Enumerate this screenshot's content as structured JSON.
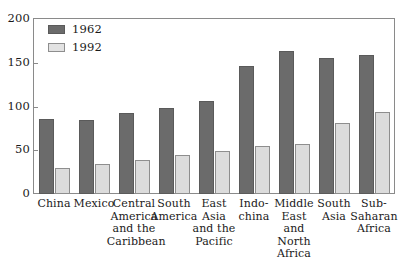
{
  "chart_data": {
    "type": "bar",
    "title": "",
    "subtitle": "",
    "xlabel": "",
    "ylabel": "",
    "ylim": [
      0,
      200
    ],
    "yticks": [
      0,
      50,
      100,
      150,
      200
    ],
    "grid": false,
    "legend_position": "top-left",
    "categories": [
      "China",
      "Mexico",
      "Central\nAmerica\nand the\nCaribbean",
      "South\nAmerica",
      "East\nAsia\nand the\nPacific",
      "Indo-\nchina",
      "Middle\nEast\nand\nNorth\nAfrica",
      "South\nAsia",
      "Sub-\nSaharan\nAfrica"
    ],
    "series": [
      {
        "name": "1962",
        "color": "#6b6b6b",
        "values": [
          86,
          85,
          93,
          98,
          106,
          146,
          163,
          155,
          159
        ]
      },
      {
        "name": "1992",
        "color": "#dcdcdc",
        "values": [
          30,
          34,
          39,
          45,
          49,
          55,
          57,
          81,
          94
        ]
      }
    ]
  },
  "legend": {
    "items": [
      {
        "label": "1962"
      },
      {
        "label": "1992"
      }
    ]
  }
}
